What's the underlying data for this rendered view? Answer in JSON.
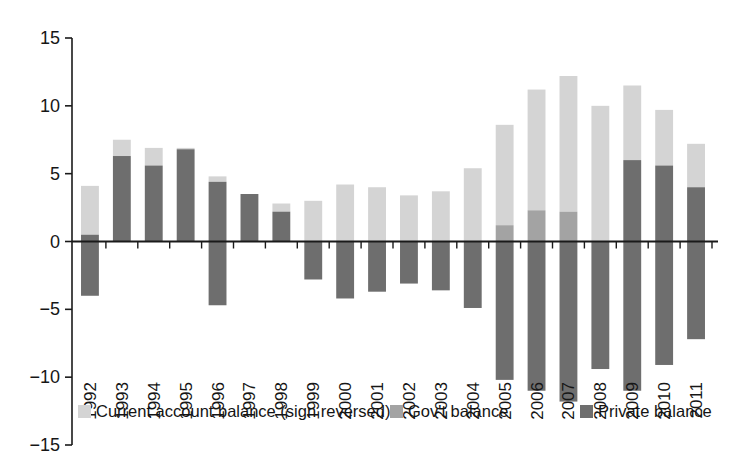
{
  "chart_data": {
    "type": "bar",
    "subtype": "stacked-diverging",
    "title": "",
    "subtitle": "",
    "xlabel": "",
    "ylabel": "",
    "ylim": [
      -15,
      15
    ],
    "y_ticks": [
      15,
      10,
      5,
      0,
      -5,
      -10,
      -15
    ],
    "y_tick_labels": [
      "15",
      "10",
      "5",
      "0",
      "−5",
      "−10",
      "−15"
    ],
    "grid": false,
    "legend_position": "bottom",
    "zero_line": true,
    "categories": [
      "1992",
      "1993",
      "1994",
      "1995",
      "1996",
      "1997",
      "1998",
      "1999",
      "2000",
      "2001",
      "2002",
      "2003",
      "2004",
      "2005",
      "2006",
      "2007",
      "2008",
      "2009",
      "2010",
      "2011"
    ],
    "series": [
      {
        "name": "Current account balance (sign reversed)",
        "color": "#d4d4d4",
        "values": [
          4.1,
          7.5,
          6.9,
          6.9,
          4.8,
          3.5,
          2.8,
          3.0,
          4.2,
          4.0,
          3.4,
          3.7,
          5.4,
          8.6,
          11.2,
          12.2,
          10.0,
          11.5,
          9.7,
          7.2
        ]
      },
      {
        "name": "Gov't balance",
        "color": "#a3a3a3",
        "values": [
          0.0,
          0.0,
          0.0,
          0.0,
          0.0,
          0.0,
          0.0,
          0.0,
          0.0,
          0.0,
          0.0,
          0.0,
          0.0,
          1.2,
          2.3,
          2.2,
          0.0,
          0.0,
          0.0,
          0.0
        ]
      },
      {
        "name": "Private balance",
        "color": "#6e6e6e",
        "values": [
          0.5,
          6.3,
          5.6,
          6.8,
          4.4,
          3.5,
          2.2,
          0.0,
          0.0,
          0.0,
          0.0,
          0.0,
          0.0,
          0.0,
          0.0,
          0.0,
          0.0,
          6.0,
          5.6,
          4.0
        ]
      }
    ],
    "negative_series": [
      {
        "name": "Private balance (negative)",
        "color": "#6e6e6e",
        "values": [
          -4.0,
          0.0,
          0.0,
          0.0,
          -4.7,
          0.0,
          0.0,
          -2.8,
          -4.2,
          -3.7,
          -3.1,
          -3.6,
          -4.9,
          -10.2,
          -11.0,
          -11.8,
          -9.4,
          -11.0,
          -9.1,
          -7.2
        ]
      }
    ],
    "bar_segments": [
      {
        "year": "1992",
        "light_top": 4.1,
        "mid_top": 0.5,
        "dark_top": 0.5,
        "bottom": -4.0
      },
      {
        "year": "1993",
        "light_top": 7.5,
        "mid_top": 6.3,
        "dark_top": 6.3,
        "bottom": 0.0
      },
      {
        "year": "1994",
        "light_top": 6.9,
        "mid_top": 5.6,
        "dark_top": 5.6,
        "bottom": 0.0
      },
      {
        "year": "1995",
        "light_top": 6.9,
        "mid_top": 6.8,
        "dark_top": 6.8,
        "bottom": 0.0
      },
      {
        "year": "1996",
        "light_top": 4.8,
        "mid_top": 4.4,
        "dark_top": 4.4,
        "bottom": -4.7
      },
      {
        "year": "1997",
        "light_top": 3.5,
        "mid_top": 3.5,
        "dark_top": 3.5,
        "bottom": 0.0
      },
      {
        "year": "1998",
        "light_top": 2.8,
        "mid_top": 2.2,
        "dark_top": 2.2,
        "bottom": 0.0
      },
      {
        "year": "1999",
        "light_top": 3.0,
        "mid_top": 0.0,
        "dark_top": 0.0,
        "bottom": -2.8
      },
      {
        "year": "2000",
        "light_top": 4.2,
        "mid_top": 0.0,
        "dark_top": 0.0,
        "bottom": -4.2
      },
      {
        "year": "2001",
        "light_top": 4.0,
        "mid_top": 0.0,
        "dark_top": 0.0,
        "bottom": -3.7
      },
      {
        "year": "2002",
        "light_top": 3.4,
        "mid_top": 0.0,
        "dark_top": 0.0,
        "bottom": -3.1
      },
      {
        "year": "2003",
        "light_top": 3.7,
        "mid_top": 0.0,
        "dark_top": 0.0,
        "bottom": -3.6
      },
      {
        "year": "2004",
        "light_top": 5.4,
        "mid_top": 0.0,
        "dark_top": 0.0,
        "bottom": -4.9
      },
      {
        "year": "2005",
        "light_top": 8.6,
        "mid_top": 1.2,
        "dark_top": 0.0,
        "bottom": -10.2
      },
      {
        "year": "2006",
        "light_top": 11.2,
        "mid_top": 2.3,
        "dark_top": 0.0,
        "bottom": -11.0
      },
      {
        "year": "2007",
        "light_top": 12.2,
        "mid_top": 2.2,
        "dark_top": 0.0,
        "bottom": -11.8
      },
      {
        "year": "2008",
        "light_top": 10.0,
        "mid_top": 0.0,
        "dark_top": 0.0,
        "bottom": -9.4
      },
      {
        "year": "2009",
        "light_top": 11.5,
        "mid_top": 6.0,
        "dark_top": 6.0,
        "bottom": -11.0
      },
      {
        "year": "2010",
        "light_top": 9.7,
        "mid_top": 5.6,
        "dark_top": 5.6,
        "bottom": -9.1
      },
      {
        "year": "2011",
        "light_top": 7.2,
        "mid_top": 4.0,
        "dark_top": 4.0,
        "bottom": -7.2
      }
    ],
    "legend": [
      {
        "label": "Current account balance (sign reversed)",
        "color": "#d4d4d4"
      },
      {
        "label": "Gov't balance",
        "color": "#a3a3a3"
      },
      {
        "label": "Private balance",
        "color": "#6e6e6e"
      }
    ]
  },
  "axes": {
    "y_tick_labels": [
      "15",
      "10",
      "5",
      "0",
      "−5",
      "−10",
      "−15"
    ],
    "x_tick_labels": [
      "1992",
      "1993",
      "1994",
      "1995",
      "1996",
      "1997",
      "1998",
      "1999",
      "2000",
      "2001",
      "2002",
      "2003",
      "2004",
      "2005",
      "2006",
      "2007",
      "2008",
      "2009",
      "2010",
      "2011"
    ]
  },
  "legend": {
    "items": [
      {
        "label": "Current account balance (sign reversed)",
        "color": "#d4d4d4"
      },
      {
        "label": "Gov't balance",
        "color": "#a3a3a3"
      },
      {
        "label": "Private balance",
        "color": "#6e6e6e"
      }
    ]
  },
  "colors": {
    "light": "#d4d4d4",
    "mid": "#a3a3a3",
    "dark": "#6e6e6e",
    "axis": "#1a1a1a",
    "background": "#ffffff"
  }
}
